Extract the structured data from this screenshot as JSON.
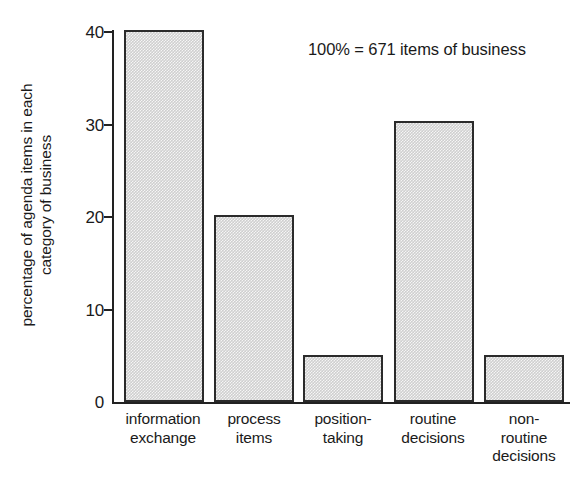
{
  "chart_data": {
    "type": "bar",
    "title": "",
    "subtitle": "",
    "xlabel": "",
    "ylabel": "percentage of agenda items in each category of business",
    "ylabel_lines": [
      "percentage of agenda items in each",
      "category of business"
    ],
    "categories": [
      "information exchange",
      "process items",
      "position-taking",
      "routine decisions",
      "non-routine decisions"
    ],
    "category_label_lines": [
      [
        "information",
        "exchange"
      ],
      [
        "process",
        "items"
      ],
      [
        "position-",
        "taking"
      ],
      [
        "routine",
        "decisions"
      ],
      [
        "non-",
        "routine",
        "decisions"
      ]
    ],
    "values": [
      40.0,
      20.1,
      5.1,
      30.2,
      5.1
    ],
    "ylim": [
      0,
      40
    ],
    "yticks": [
      0,
      10,
      20,
      30,
      40
    ],
    "ytick_labels": [
      "0",
      "10",
      "20",
      "30",
      "40"
    ],
    "grid": false,
    "legend": false,
    "annotations": [
      "100% = 671 items of business"
    ],
    "bar_fill_color": "#cfcfcf",
    "bar_edge_color": "#2b2b2b",
    "axis_color": "#222222",
    "background_color": "#ffffff"
  },
  "annotation": {
    "text": "100% = 671 items of business"
  }
}
